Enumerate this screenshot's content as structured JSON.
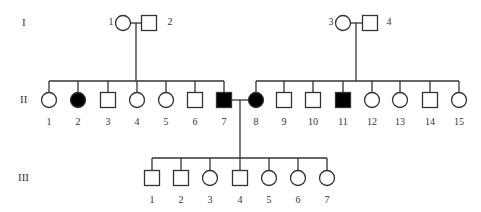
{
  "diagram": {
    "type": "pedigree",
    "colors": {
      "line": "#333333",
      "affected_fill": "#000000",
      "unaffected_fill": "#ffffff"
    },
    "generations": [
      {
        "label": "I",
        "y": 23,
        "label_x": 22
      },
      {
        "label": "II",
        "y": 100,
        "label_x": 20
      },
      {
        "label": "III",
        "y": 178,
        "label_x": 18
      }
    ],
    "individuals": {
      "I": [
        {
          "id": "1",
          "sex": "female",
          "affected": false,
          "x": 123,
          "label_x": 111,
          "label_side": "left"
        },
        {
          "id": "2",
          "sex": "male",
          "affected": false,
          "x": 149,
          "label_x": 170,
          "label_side": "right"
        },
        {
          "id": "3",
          "sex": "female",
          "affected": false,
          "x": 343,
          "label_x": 331,
          "label_side": "left"
        },
        {
          "id": "4",
          "sex": "male",
          "affected": false,
          "x": 370,
          "label_x": 389,
          "label_side": "right"
        }
      ],
      "II": [
        {
          "id": "1",
          "sex": "female",
          "affected": false,
          "x": 49
        },
        {
          "id": "2",
          "sex": "female",
          "affected": true,
          "x": 78
        },
        {
          "id": "3",
          "sex": "male",
          "affected": false,
          "x": 108
        },
        {
          "id": "4",
          "sex": "female",
          "affected": false,
          "x": 137
        },
        {
          "id": "5",
          "sex": "female",
          "affected": false,
          "x": 166
        },
        {
          "id": "6",
          "sex": "male",
          "affected": false,
          "x": 195
        },
        {
          "id": "7",
          "sex": "male",
          "affected": true,
          "x": 224
        },
        {
          "id": "8",
          "sex": "female",
          "affected": true,
          "x": 256
        },
        {
          "id": "9",
          "sex": "male",
          "affected": false,
          "x": 284
        },
        {
          "id": "10",
          "sex": "male",
          "affected": false,
          "x": 313
        },
        {
          "id": "11",
          "sex": "male",
          "affected": true,
          "x": 343
        },
        {
          "id": "12",
          "sex": "female",
          "affected": false,
          "x": 372
        },
        {
          "id": "13",
          "sex": "female",
          "affected": false,
          "x": 400
        },
        {
          "id": "14",
          "sex": "male",
          "affected": false,
          "x": 430
        },
        {
          "id": "15",
          "sex": "female",
          "affected": false,
          "x": 459
        }
      ],
      "III": [
        {
          "id": "1",
          "sex": "male",
          "affected": false,
          "x": 152
        },
        {
          "id": "2",
          "sex": "male",
          "affected": false,
          "x": 181
        },
        {
          "id": "3",
          "sex": "female",
          "affected": false,
          "x": 210
        },
        {
          "id": "4",
          "sex": "male",
          "affected": false,
          "x": 240
        },
        {
          "id": "5",
          "sex": "female",
          "affected": false,
          "x": 269
        },
        {
          "id": "6",
          "sex": "female",
          "affected": false,
          "x": 298
        },
        {
          "id": "7",
          "sex": "female",
          "affected": false,
          "x": 327
        }
      ]
    },
    "unions": [
      {
        "partners": [
          "I-1",
          "I-2"
        ],
        "drop_x": 136,
        "sibship_y": 81,
        "sibship_x1": 49,
        "sibship_x2": 224,
        "children_gen": "II"
      },
      {
        "partners": [
          "I-3",
          "I-4"
        ],
        "drop_x": 356,
        "sibship_y": 81,
        "sibship_x1": 256,
        "sibship_x2": 459,
        "children_gen": "II"
      },
      {
        "partners": [
          "II-7",
          "II-8"
        ],
        "drop_x": 240,
        "sibship_y": 158,
        "sibship_x1": 152,
        "sibship_x2": 327,
        "children_gen": "III"
      }
    ]
  }
}
